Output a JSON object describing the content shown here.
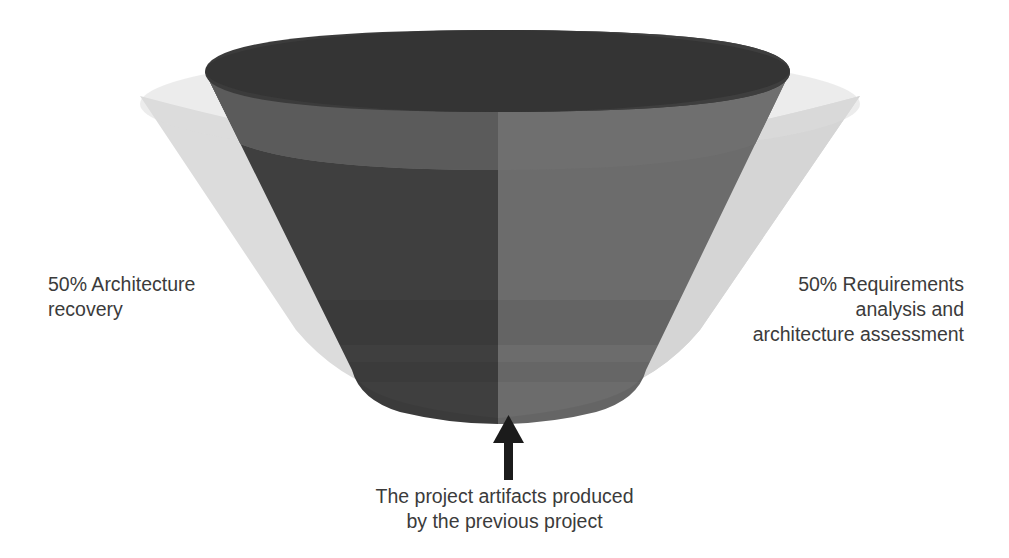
{
  "diagram": {
    "type": "funnel-cone-3d",
    "title": "",
    "labels": {
      "left": "50% Architecture\nrecovery",
      "right": "50% Requirements\nanalysis and\narchitecture assessment",
      "bottom": "The project artifacts produced\nby the previous project"
    },
    "annotations": {
      "arrow": "up-arrow pointing to funnel outlet"
    },
    "colors": {
      "background": "#ffffff",
      "outer_cone": "#dcdcdc",
      "outer_cone_shade": "#d2d2d2",
      "funnel_left_dark": "#3e3e3e",
      "funnel_right_mid": "#6b6b6b",
      "funnel_rim_top": "#3a3a3a",
      "funnel_inner_band": "#6e6e6e",
      "funnel_inner_band_dark": "#525252",
      "arrow": "#1b1b1b",
      "text": "#3b3b3b"
    },
    "segments": [
      {
        "name": "architecture-recovery",
        "share": "50%",
        "side": "left"
      },
      {
        "name": "requirements-analysis-and-architecture-assessment",
        "share": "50%",
        "side": "right"
      }
    ]
  }
}
